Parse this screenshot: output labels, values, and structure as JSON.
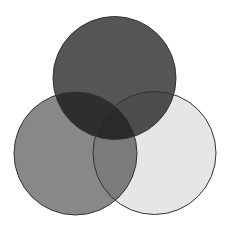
{
  "diagram": {
    "type": "venn",
    "sets": [
      {
        "name": "top-circle",
        "cx": 114.5,
        "cy": 78,
        "r": 61.5,
        "fill": "#555555"
      },
      {
        "name": "left-circle",
        "cx": 75.5,
        "cy": 153.5,
        "r": 61.5,
        "fill": "#888888"
      },
      {
        "name": "right-circle",
        "cx": 154.5,
        "cy": 153,
        "r": 61.5,
        "fill": "#e6e6e6"
      }
    ],
    "stroke": "#333333",
    "background": "#ffffff"
  }
}
